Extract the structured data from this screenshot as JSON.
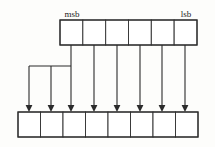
{
  "diagram": {
    "colors": {
      "background": "#fdfdfb",
      "cell_fill": "#ffffff",
      "stroke": "#2b2b2b",
      "cell_stroke": "#3a3a3a",
      "text": "#1a1a1a"
    },
    "labels": {
      "msb": "msb",
      "lsb": "lsb"
    },
    "source_register": {
      "name": "source-register",
      "cell_count": 6,
      "x": 60,
      "y": 20,
      "width": 137,
      "height": 25,
      "cells": [
        "",
        "",
        "",
        "",
        "",
        ""
      ]
    },
    "destination_register": {
      "name": "destination-register",
      "cell_count": 8,
      "x": 18,
      "y": 112,
      "width": 180,
      "height": 25,
      "cells": [
        "",
        "",
        "",
        "",
        "",
        "",
        "",
        ""
      ]
    },
    "label_positions": {
      "msb_x": 72,
      "msb_y": 17,
      "lsb_x": 186,
      "lsb_y": 17
    },
    "routing": {
      "branch_y": 66,
      "arrow_tip_y": 112,
      "fanout_verticals_x": [
        29,
        51
      ],
      "source_tap_x": [
        71,
        94,
        117,
        140,
        162,
        185
      ],
      "dest_target_x": [
        29,
        51,
        71,
        94,
        117,
        140,
        162,
        185
      ],
      "branch_line_from_x": 29,
      "branch_line_to_x": 71
    }
  }
}
